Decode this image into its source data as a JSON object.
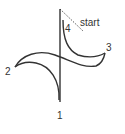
{
  "diagram": {
    "type": "stroke-order",
    "stroke_color": "#333333",
    "labels": {
      "start": "start",
      "p1": "1",
      "p2": "2",
      "p3": "3",
      "p4": "4"
    }
  }
}
